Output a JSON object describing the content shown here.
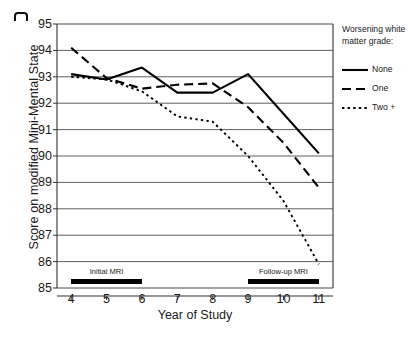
{
  "figure": {
    "corner_mark": "corner-artifact"
  },
  "chart_data": {
    "type": "line",
    "title": "",
    "xlabel": "Year of Study",
    "ylabel": "Score on modified Mini-Mental State",
    "x": [
      4,
      5,
      6,
      7,
      8,
      9,
      10,
      11
    ],
    "xtick_labels": [
      "4",
      "5",
      "6",
      "7",
      "8",
      "9",
      "10",
      "11"
    ],
    "ytick_labels": [
      "95",
      "94",
      "93",
      "92",
      "91",
      "90",
      "89",
      "88",
      "87",
      "86",
      "85"
    ],
    "xlim": [
      3.6,
      11.4
    ],
    "ylim": [
      85,
      95
    ],
    "grid": "horizontal",
    "legend_position": "right-outside",
    "legend_title": "Worsening white matter grade:",
    "series": [
      {
        "name": "None",
        "style": "solid",
        "values": [
          93.1,
          92.9,
          93.35,
          92.4,
          92.4,
          93.1,
          91.6,
          90.1
        ]
      },
      {
        "name": "One",
        "style": "dashed",
        "values": [
          94.1,
          92.95,
          92.55,
          92.7,
          92.75,
          91.85,
          90.5,
          88.8
        ]
      },
      {
        "name": "Two +",
        "style": "dotted",
        "values": [
          93.0,
          92.9,
          92.45,
          91.5,
          91.3,
          90.0,
          88.3,
          85.9
        ]
      }
    ],
    "annotations": [
      {
        "label": "Initial MRI",
        "x_start": 4,
        "x_end": 6,
        "y": 85.25
      },
      {
        "label": "Follow-up MRI",
        "x_start": 9,
        "x_end": 11,
        "y": 85.25
      }
    ]
  }
}
